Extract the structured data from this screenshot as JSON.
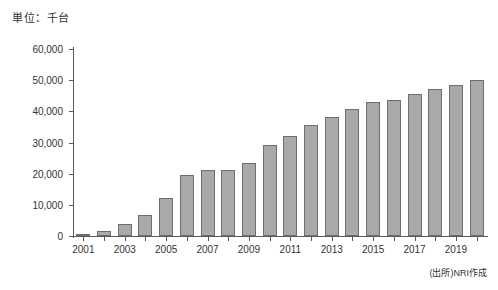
{
  "unit_label": "単位：千台",
  "source_note": "(出所)NRI作成",
  "colors": {
    "bar_fill": "#a9a9a9",
    "bar_border": "#6e6e6e",
    "axis": "#5a5a5a",
    "text": "#333333",
    "background": "#ffffff"
  },
  "chart_data": {
    "type": "bar",
    "title": "",
    "subtitle": "",
    "xlabel": "",
    "ylabel": "単位：千台",
    "ylim": [
      0,
      60000
    ],
    "ytick_labels": [
      "0",
      "10,000",
      "20,000",
      "30,000",
      "40,000",
      "50,000",
      "60,000"
    ],
    "ytick_values": [
      0,
      10000,
      20000,
      30000,
      40000,
      50000,
      60000
    ],
    "xtick_labels": [
      "2001",
      "2003",
      "2005",
      "2007",
      "2009",
      "2011",
      "2013",
      "2015",
      "2017",
      "2019"
    ],
    "grid": false,
    "legend": "none",
    "categories": [
      "2001",
      "2002",
      "2003",
      "2004",
      "2005",
      "2006",
      "2007",
      "2008",
      "2009",
      "2010",
      "2011",
      "2012",
      "2013",
      "2014",
      "2015",
      "2016",
      "2017",
      "2018",
      "2019",
      "2020"
    ],
    "values": [
      400,
      1600,
      4000,
      6900,
      12200,
      19500,
      21300,
      21100,
      23500,
      29300,
      32000,
      35500,
      38200,
      40900,
      43000,
      43500,
      45600,
      47100,
      48500,
      50000
    ]
  }
}
